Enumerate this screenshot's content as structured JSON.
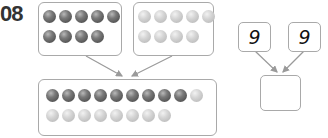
{
  "problem": {
    "number": "08"
  },
  "ball_diagram": {
    "left_group": {
      "color": "dark",
      "rows": [
        5,
        4
      ],
      "count": 9
    },
    "right_group": {
      "color": "light",
      "rows": [
        5,
        4
      ],
      "count": 9
    },
    "combined_group": {
      "row1": {
        "dark": 9,
        "light": 1
      },
      "row2": {
        "dark": 0,
        "light": 8
      }
    }
  },
  "number_bond": {
    "left_value": "9",
    "right_value": "9",
    "answer_value": ""
  },
  "colors": {
    "border": "#a9a9a9",
    "dark_ball": "#5a5a5a",
    "light_ball": "#c8c8c8",
    "arrow": "#9a9a9a"
  }
}
